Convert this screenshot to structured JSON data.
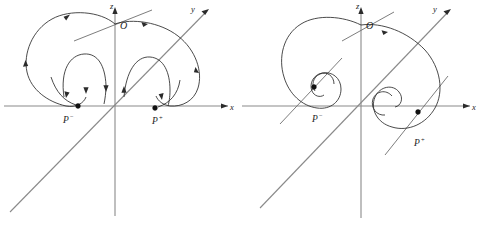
{
  "figure": {
    "background_color": "#ffffff",
    "curve_color": "#2b2b2b",
    "axis_color": "#8a8a8a",
    "label_color": "#1d1d1d",
    "width": 484,
    "height": 241,
    "panel_count": 2
  },
  "panels": [
    {
      "id": "left",
      "name": "panel-left",
      "description": "Homoclinic-type trajectories spiralling outward from the origin and approaching the two fixed points P- and P+",
      "axes": [
        {
          "name": "z-axis",
          "label": "z",
          "orientation": "vertical",
          "arrow": "up"
        },
        {
          "name": "x-axis",
          "label": "x",
          "orientation": "horizontal",
          "arrow": "right"
        },
        {
          "name": "y-axis",
          "label": "y",
          "orientation": "diagonal",
          "arrow": "up-right"
        }
      ],
      "origin": {
        "label": "O"
      },
      "fixed_points": [
        {
          "name": "P-minus",
          "label": "P",
          "superscript": "−"
        },
        {
          "name": "P-plus",
          "label": "P",
          "superscript": "+"
        }
      ],
      "trajectory_count": 2,
      "flow_arrows": 9
    },
    {
      "id": "right",
      "name": "panel-right",
      "description": "Trajectories spiralling inward onto the two stable foci P- and P+",
      "axes": [
        {
          "name": "z-axis",
          "label": "z",
          "orientation": "vertical",
          "arrow": "up"
        },
        {
          "name": "x-axis",
          "label": "x",
          "orientation": "horizontal",
          "arrow": "right"
        },
        {
          "name": "y-axis",
          "label": "y",
          "orientation": "diagonal",
          "arrow": "up-right"
        }
      ],
      "origin": {
        "label": "O"
      },
      "fixed_points": [
        {
          "name": "P-minus",
          "label": "P",
          "superscript": "−"
        },
        {
          "name": "P-plus",
          "label": "P",
          "superscript": "+"
        }
      ],
      "trajectory_count": 2,
      "flow_arrows": 1
    }
  ],
  "labels": {
    "z": "z",
    "y": "y",
    "x": "x",
    "origin": "O",
    "p_base": "P",
    "p_minus_sup": "−",
    "p_plus_sup": "+"
  }
}
